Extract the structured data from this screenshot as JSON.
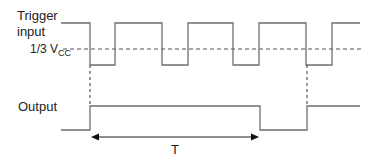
{
  "diagram": {
    "labels": {
      "trigger_line1": "Trigger",
      "trigger_line2": "input",
      "threshold_prefix": "1/3 V",
      "threshold_sub": "CC",
      "output": "Output",
      "period": "T"
    },
    "colors": {
      "waveform": "#6e6e6e",
      "dashed": "#555555",
      "arrow": "#111111",
      "text": "#222222"
    },
    "trigger_waveform": {
      "high_y": 23,
      "low_y": 65,
      "edges_x": [
        61,
        90,
        115,
        162,
        188,
        233,
        259,
        306,
        332,
        360
      ],
      "levels": [
        "high",
        "low",
        "high",
        "low",
        "high",
        "low",
        "high",
        "low",
        "high"
      ]
    },
    "threshold_line_y": 49,
    "output_waveform": {
      "high_y": 106,
      "low_y": 130,
      "edges_x": [
        61,
        90,
        260,
        307,
        360
      ],
      "levels": [
        "low",
        "high",
        "low",
        "high"
      ]
    },
    "trigger_markers_x": [
      90,
      307
    ],
    "period_arrow": {
      "x1": 91,
      "x2": 259,
      "y": 137
    }
  }
}
